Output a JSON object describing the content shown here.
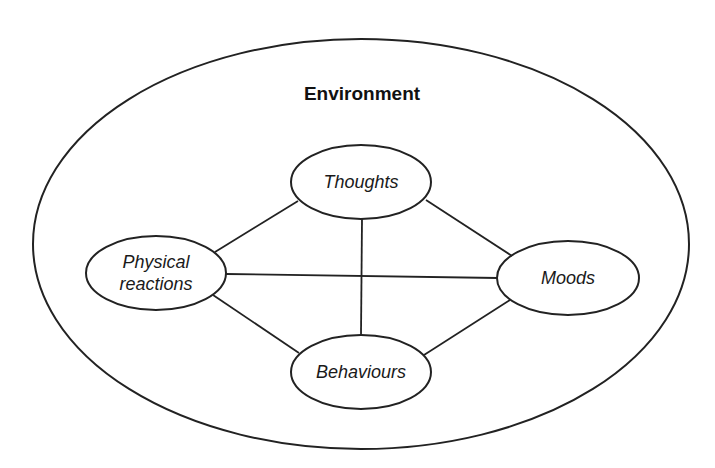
{
  "diagram": {
    "title": "Environment",
    "outer": {
      "cx": 361,
      "cy": 244,
      "rx": 328,
      "ry": 205
    },
    "title_pos": {
      "x": 362,
      "y": 100
    },
    "nodes": [
      {
        "id": "thoughts",
        "lines": [
          "Thoughts"
        ],
        "cx": 361,
        "cy": 182,
        "rx": 70,
        "ry": 37
      },
      {
        "id": "physical-reactions",
        "lines": [
          "Physical",
          "reactions"
        ],
        "cx": 156,
        "cy": 273,
        "rx": 70,
        "ry": 37
      },
      {
        "id": "moods",
        "lines": [
          "Moods"
        ],
        "cx": 568,
        "cy": 278,
        "rx": 71,
        "ry": 37
      },
      {
        "id": "behaviours",
        "lines": [
          "Behaviours"
        ],
        "cx": 361,
        "cy": 372,
        "rx": 70,
        "ry": 37
      }
    ],
    "edges": [
      {
        "from": "thoughts",
        "to": "physical-reactions",
        "x1": 298,
        "y1": 201,
        "x2": 215,
        "y2": 252
      },
      {
        "from": "thoughts",
        "to": "moods",
        "x1": 426,
        "y1": 200,
        "x2": 512,
        "y2": 256
      },
      {
        "from": "thoughts",
        "to": "behaviours",
        "x1": 362,
        "y1": 219,
        "x2": 361,
        "y2": 335
      },
      {
        "from": "physical-reactions",
        "to": "moods",
        "x1": 226,
        "y1": 274,
        "x2": 498,
        "y2": 278
      },
      {
        "from": "physical-reactions",
        "to": "behaviours",
        "x1": 213,
        "y1": 295,
        "x2": 299,
        "y2": 353
      },
      {
        "from": "moods",
        "to": "behaviours",
        "x1": 510,
        "y1": 300,
        "x2": 424,
        "y2": 355
      }
    ],
    "colors": {
      "stroke": "#222222",
      "text": "#1a1a1a",
      "background": "#ffffff"
    }
  }
}
